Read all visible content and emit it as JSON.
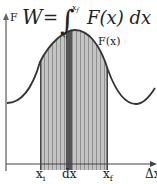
{
  "diagram": {
    "equation": {
      "lhs": "W",
      "equals": "=",
      "integral": "∫",
      "upper_limit": "x_f",
      "lower_limit": "x_i",
      "integrand": "F(x) dx",
      "integrand_func": "F(x)",
      "differential": "dx"
    },
    "axes": {
      "y_label": "F",
      "x_label": "Δx"
    },
    "curve_label": "F(x)",
    "x_markers": [
      "x_i",
      "dx",
      "x_f"
    ],
    "x_marker_labels": {
      "xi_base": "x",
      "xi_sub": "i",
      "dx": "dx",
      "xf_base": "x",
      "xf_sub": "f"
    },
    "colors": {
      "axis": "#666666",
      "curve": "#333333",
      "shade_fill": "#bdbdbd",
      "stripe": "#9a9a9a",
      "dx_strip": "#555555",
      "text": "#222222"
    }
  }
}
